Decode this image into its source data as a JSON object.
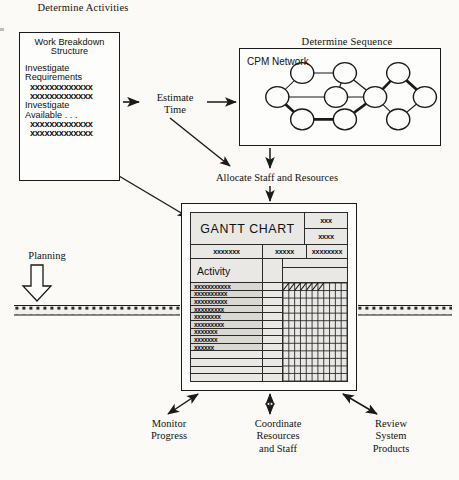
{
  "diagram": {
    "ink_color": "#1a1a1a",
    "paper_color": "#fbfaf7"
  },
  "headings": {
    "determine_activities": "Determine Activities",
    "determine_sequence": "Determine Sequence",
    "estimate_time": "Estimate\nTime",
    "allocate": "Allocate Staff and Resources",
    "planning": "Planning"
  },
  "wbs_box": {
    "lines": [
      {
        "text": "Work Breakdown",
        "style": "title"
      },
      {
        "text": "Structure",
        "style": "title"
      },
      {
        "text": "",
        "style": "gap"
      },
      {
        "text": "Investigate",
        "style": "head"
      },
      {
        "text": "Requirements",
        "style": "head"
      },
      {
        "text": "xxxxxxxxxxxxx",
        "style": "x"
      },
      {
        "text": "xxxxxxxxxxxxx",
        "style": "x"
      },
      {
        "text": "Investigate",
        "style": "head"
      },
      {
        "text": "Available . . .",
        "style": "head"
      },
      {
        "text": "xxxxxxxxxxxxx",
        "style": "x"
      },
      {
        "text": "xxxxxxxxxxxxx",
        "style": "x"
      }
    ]
  },
  "cpm": {
    "title": "CPM Network",
    "nodes": [
      {
        "id": "n1",
        "cx": 42,
        "cy": 60
      },
      {
        "id": "n2",
        "cx": 70,
        "cy": 30
      },
      {
        "id": "n3",
        "cx": 70,
        "cy": 88
      },
      {
        "id": "n4",
        "cx": 108,
        "cy": 60
      },
      {
        "id": "n5",
        "cx": 118,
        "cy": 30
      },
      {
        "id": "n6",
        "cx": 118,
        "cy": 88
      },
      {
        "id": "n7",
        "cx": 152,
        "cy": 60
      },
      {
        "id": "n8",
        "cx": 178,
        "cy": 30
      },
      {
        "id": "n9",
        "cx": 178,
        "cy": 88
      },
      {
        "id": "n10",
        "cx": 208,
        "cy": 60
      }
    ],
    "edges": [
      {
        "from": "n1",
        "to": "n2",
        "bold": false
      },
      {
        "from": "n1",
        "to": "n3",
        "bold": true
      },
      {
        "from": "n1",
        "to": "n4",
        "bold": false
      },
      {
        "from": "n2",
        "to": "n5",
        "bold": false
      },
      {
        "from": "n3",
        "to": "n6",
        "bold": true
      },
      {
        "from": "n4",
        "to": "n5",
        "bold": false
      },
      {
        "from": "n4",
        "to": "n7",
        "bold": false
      },
      {
        "from": "n5",
        "to": "n7",
        "bold": false
      },
      {
        "from": "n6",
        "to": "n7",
        "bold": true
      },
      {
        "from": "n7",
        "to": "n8",
        "bold": true
      },
      {
        "from": "n7",
        "to": "n9",
        "bold": false
      },
      {
        "from": "n8",
        "to": "n10",
        "bold": true
      },
      {
        "from": "n9",
        "to": "n10",
        "bold": false
      }
    ],
    "node_radius": 13
  },
  "gantt": {
    "title": "GANTT CHART",
    "title_right": [
      "xxx",
      "xxxx"
    ],
    "sub_headers": [
      "xxxxxxx",
      "xxxxx",
      "xxxxxxxx"
    ],
    "activity_label": "Activity",
    "rows": [
      "xxxxxxxxxxx",
      "xxxxxxxxxx",
      "xxxxxxxxxx",
      "xxxxxxxxx",
      "xxxxxxxx",
      "xxxxxxxxx",
      "xxxxxxx",
      "xxxxxxx",
      "xxxxxx",
      "",
      "",
      "",
      ""
    ],
    "grid_columns": 11,
    "bar": {
      "row_index": 0,
      "start_col": 0,
      "end_col": 6,
      "fill": "hatched-diagonal"
    }
  },
  "callouts": [
    {
      "name": "monitor-progress",
      "text": "Monitor\nProgress"
    },
    {
      "name": "coordinate-resources",
      "text": "Coordinate\nResources\nand Staff"
    },
    {
      "name": "review-system",
      "text": "Review\nSystem\nProducts"
    }
  ],
  "icons": {
    "planning_arrow": "hollow-down-arrow-icon",
    "flow_arrow": "arrow-icon",
    "double_arrow": "double-headed-arrow-icon"
  }
}
